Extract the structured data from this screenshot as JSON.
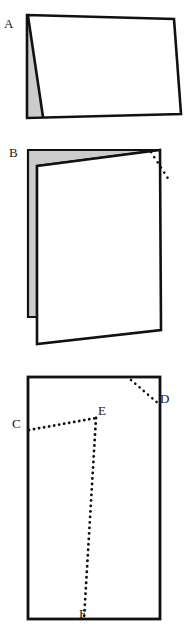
{
  "figure": {
    "background_color": "#ffffff",
    "stroke_color": "#111111",
    "shade_color": "#cccccc",
    "dot_color": "#111111",
    "labels": {
      "a": "A",
      "b": "B",
      "c": "C",
      "d": "D",
      "e": "E",
      "f": "F"
    },
    "panels": [
      {
        "id": "panel-a",
        "label": "A",
        "description": "Tent-folded sheet seen from the side, small shaded triangular flap at the left",
        "outline_points": "27,14 175,19 181,113 27,119",
        "fold_line": "27,14 42,117",
        "shaded_region": "27,14 42,117 27,119"
      },
      {
        "id": "panel-b",
        "label": "B",
        "description": "Folded sheet standing upright, shaded back panel visible behind, dotted crease at upper right corner",
        "front_points": "36,164 161,149 161,330 36,344",
        "back_points": "27,149 161,149 36,164 27,318",
        "shaded_region": "27,149 161,149 36,164 36,318 27,318",
        "dotted_segment": "152,152 168,178"
      },
      {
        "id": "panel-c",
        "label": "Unfolded sheet",
        "description": "Flat rectangle with dotted crease lines and labelled points C, D, E, F",
        "outline_points": "27,376 161,376 161,620 27,620",
        "creases": [
          {
            "name": "crease-cd-corner",
            "from": "131,380",
            "to": "160,404"
          },
          {
            "name": "crease-ce",
            "from": "28,430",
            "to": "96,418"
          },
          {
            "name": "crease-ef",
            "from": "96,418",
            "to": "84,619"
          }
        ]
      }
    ]
  }
}
